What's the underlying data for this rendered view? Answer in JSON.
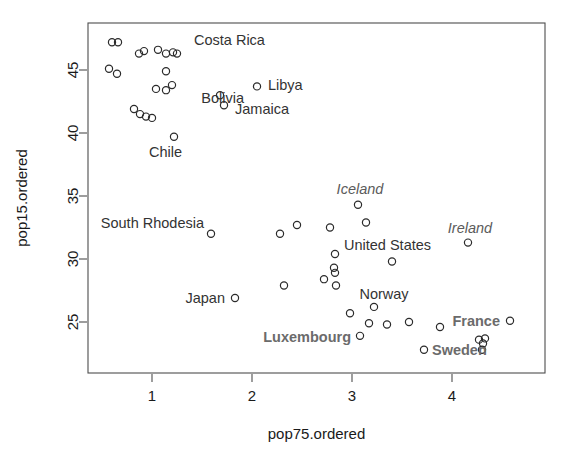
{
  "chart_data": {
    "type": "scatter",
    "title": "",
    "xlabel": "pop75.ordered",
    "ylabel": "pop15.ordered",
    "xlim": [
      0.45,
      4.7
    ],
    "ylim": [
      21.2,
      48.2
    ],
    "xticks": [
      1,
      2,
      3,
      4
    ],
    "yticks": [
      25,
      30,
      35,
      40,
      45
    ],
    "grid": false,
    "legend": null,
    "point_marker": "open-circle",
    "points": [
      {
        "x": 0.6,
        "y": 47.2
      },
      {
        "x": 0.66,
        "y": 47.2
      },
      {
        "x": 0.57,
        "y": 45.1
      },
      {
        "x": 0.65,
        "y": 44.7
      },
      {
        "x": 0.87,
        "y": 46.3
      },
      {
        "x": 0.92,
        "y": 46.5
      },
      {
        "x": 1.06,
        "y": 46.6
      },
      {
        "x": 1.14,
        "y": 46.3
      },
      {
        "x": 1.21,
        "y": 46.4
      },
      {
        "x": 1.25,
        "y": 46.3
      },
      {
        "x": 1.14,
        "y": 44.9
      },
      {
        "x": 1.2,
        "y": 43.8
      },
      {
        "x": 1.04,
        "y": 43.5
      },
      {
        "x": 1.14,
        "y": 43.4
      },
      {
        "x": 0.82,
        "y": 41.9
      },
      {
        "x": 0.88,
        "y": 41.5
      },
      {
        "x": 0.94,
        "y": 41.3
      },
      {
        "x": 1.0,
        "y": 41.2
      },
      {
        "x": 1.22,
        "y": 39.7
      },
      {
        "x": 1.68,
        "y": 43.0
      },
      {
        "x": 1.72,
        "y": 42.2
      },
      {
        "x": 2.05,
        "y": 43.7
      },
      {
        "x": 1.59,
        "y": 32.0
      },
      {
        "x": 2.28,
        "y": 32.0
      },
      {
        "x": 2.45,
        "y": 32.7
      },
      {
        "x": 2.78,
        "y": 32.5
      },
      {
        "x": 3.06,
        "y": 34.3
      },
      {
        "x": 3.14,
        "y": 32.9
      },
      {
        "x": 4.16,
        "y": 31.3
      },
      {
        "x": 2.83,
        "y": 30.4
      },
      {
        "x": 3.4,
        "y": 29.8
      },
      {
        "x": 2.82,
        "y": 29.3
      },
      {
        "x": 2.83,
        "y": 28.9
      },
      {
        "x": 2.72,
        "y": 28.4
      },
      {
        "x": 2.84,
        "y": 27.9
      },
      {
        "x": 2.32,
        "y": 27.9
      },
      {
        "x": 1.83,
        "y": 26.9
      },
      {
        "x": 3.22,
        "y": 26.2
      },
      {
        "x": 2.98,
        "y": 25.7
      },
      {
        "x": 3.17,
        "y": 24.9
      },
      {
        "x": 3.35,
        "y": 24.8
      },
      {
        "x": 3.57,
        "y": 25.0
      },
      {
        "x": 3.88,
        "y": 24.6
      },
      {
        "x": 4.27,
        "y": 23.6
      },
      {
        "x": 4.31,
        "y": 23.3
      },
      {
        "x": 4.33,
        "y": 23.7
      },
      {
        "x": 4.58,
        "y": 25.1
      },
      {
        "x": 3.08,
        "y": 23.9
      },
      {
        "x": 3.72,
        "y": 22.8
      },
      {
        "x": 4.3,
        "y": 22.8
      }
    ],
    "annotations": [
      {
        "text": "Costa Rica",
        "x": 1.42,
        "y": 47.35,
        "anchor": "start",
        "style": "plain"
      },
      {
        "text": "Libya",
        "x": 2.16,
        "y": 43.85,
        "anchor": "start",
        "style": "plain"
      },
      {
        "text": "Bolivia",
        "x": 1.92,
        "y": 42.8,
        "anchor": "end",
        "style": "plain"
      },
      {
        "text": "Jamaica",
        "x": 1.83,
        "y": 41.95,
        "anchor": "start",
        "style": "plain"
      },
      {
        "text": "Chile",
        "x": 1.3,
        "y": 38.5,
        "anchor": "end",
        "style": "plain"
      },
      {
        "text": "Iceland",
        "x": 3.08,
        "y": 35.6,
        "anchor": "middle",
        "style": "italic"
      },
      {
        "text": "Ireland",
        "x": 4.18,
        "y": 32.5,
        "anchor": "middle",
        "style": "italic"
      },
      {
        "text": "South Rhodesia",
        "x": 1.52,
        "y": 32.9,
        "anchor": "end",
        "style": "plain"
      },
      {
        "text": "United States",
        "x": 2.92,
        "y": 31.1,
        "anchor": "start",
        "style": "plain"
      },
      {
        "text": "Japan",
        "x": 1.73,
        "y": 26.9,
        "anchor": "end",
        "style": "plain"
      },
      {
        "text": "Norway",
        "x": 3.32,
        "y": 27.2,
        "anchor": "middle",
        "style": "plain"
      },
      {
        "text": "France",
        "x": 4.48,
        "y": 25.1,
        "anchor": "end",
        "style": "boldgray"
      },
      {
        "text": "Luxembourg",
        "x": 2.99,
        "y": 23.8,
        "anchor": "end",
        "style": "boldgray"
      },
      {
        "text": "Sweden",
        "x": 3.8,
        "y": 22.75,
        "anchor": "start",
        "style": "boldgray"
      }
    ]
  },
  "axes": {
    "x_tick_labels": [
      "1",
      "2",
      "3",
      "4"
    ],
    "y_tick_labels": [
      "25",
      "30",
      "35",
      "40",
      "45"
    ],
    "x_title": "pop75.ordered",
    "y_title": "pop15.ordered"
  },
  "colors": {
    "frame": "#4d4d4d",
    "point": "#2b2b2b",
    "label": "#333333",
    "italic_label": "#5b5b5b",
    "bold_label": "#6b6b6b"
  }
}
